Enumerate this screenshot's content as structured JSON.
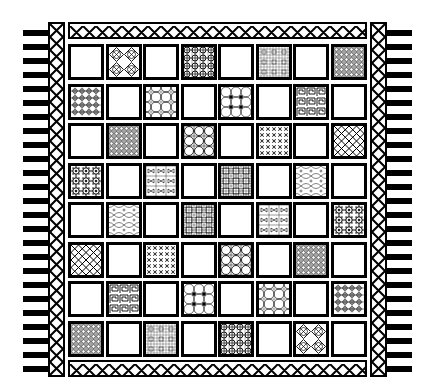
{
  "rug": {
    "description": "Rug with 8x8 checkerboard of plain and patterned tiles, lattice border, fringe",
    "colors": {
      "ink": "#000000",
      "background": "#ffffff"
    },
    "grid": {
      "rows": 8,
      "cols": 8,
      "cells": [
        [
          "plain",
          "quatrefoil",
          "plain",
          "dense-star",
          "plain",
          "light-grid",
          "plain",
          "dense-lattice"
        ],
        [
          "cross-grid",
          "plain",
          "circle-lattice",
          "plain",
          "flower-circles",
          "plain",
          "greek-key",
          "plain"
        ],
        [
          "plain",
          "dense-lattice",
          "plain",
          "circle-grid",
          "plain",
          "star-grid",
          "plain",
          "diamond-lattice"
        ],
        [
          "flower-rosette",
          "plain",
          "bowtie-grid",
          "plain",
          "fine-grid",
          "plain",
          "arc-lattice",
          "plain"
        ],
        [
          "plain",
          "arc-lattice",
          "plain",
          "fine-grid",
          "plain",
          "bowtie-grid",
          "plain",
          "flower-rosette"
        ],
        [
          "diamond-lattice",
          "plain",
          "star-grid",
          "plain",
          "circle-grid",
          "plain",
          "dense-lattice",
          "plain"
        ],
        [
          "plain",
          "greek-key",
          "plain",
          "flower-circles",
          "plain",
          "circle-lattice",
          "plain",
          "cross-grid"
        ],
        [
          "dense-lattice",
          "plain",
          "light-grid",
          "plain",
          "dense-star",
          "plain",
          "quatrefoil",
          "plain"
        ]
      ]
    },
    "border": {
      "pattern": "diamond-lattice"
    },
    "fringe": {
      "left_count": 25,
      "right_count": 25
    }
  }
}
